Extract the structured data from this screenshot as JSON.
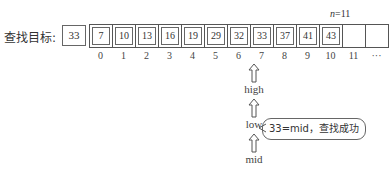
{
  "target": {
    "label": "查找目标:",
    "value": "33"
  },
  "n_label": {
    "var": "n",
    "eq": "=11"
  },
  "array": {
    "values": [
      "7",
      "10",
      "13",
      "16",
      "19",
      "29",
      "32",
      "33",
      "37",
      "41",
      "43",
      "",
      ""
    ],
    "indices": [
      "0",
      "1",
      "2",
      "3",
      "4",
      "5",
      "6",
      "7",
      "8",
      "9",
      "10",
      "11",
      "···"
    ]
  },
  "pointers": {
    "high": "high",
    "low": "low",
    "mid": "mid",
    "index": 7
  },
  "callout": "33=mid，查找成功"
}
